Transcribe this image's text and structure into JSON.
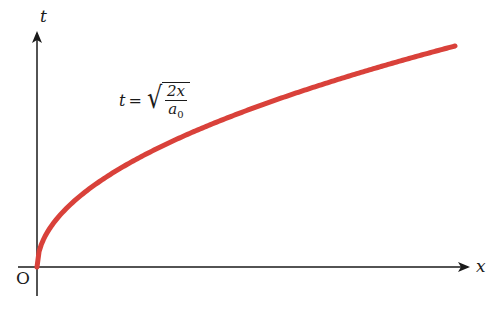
{
  "diagram": {
    "axes": {
      "x_label": "x",
      "y_label": "t",
      "origin_label": "O",
      "axis_color": "#1a1a1a"
    },
    "curve": {
      "color": "#d9413a",
      "description": "square-root curve starting at origin",
      "formula": {
        "lhs": "t",
        "eq": "=",
        "numerator": "2x",
        "denominator_base": "a",
        "denominator_sub": "0"
      }
    }
  },
  "chart_data": {
    "type": "line",
    "title": "",
    "xlabel": "x",
    "ylabel": "t",
    "series": [
      {
        "name": "t = sqrt(2x/a0)",
        "x": [
          0,
          0.1,
          0.2,
          0.3,
          0.4,
          0.5,
          0.6,
          0.7,
          0.8,
          0.9,
          1.0
        ],
        "values": [
          0,
          0.316,
          0.447,
          0.548,
          0.632,
          0.707,
          0.775,
          0.837,
          0.894,
          0.949,
          1.0
        ]
      }
    ],
    "grid": false,
    "legend": "none",
    "annotations": [
      "t = √(2x/a₀)",
      "O"
    ]
  }
}
